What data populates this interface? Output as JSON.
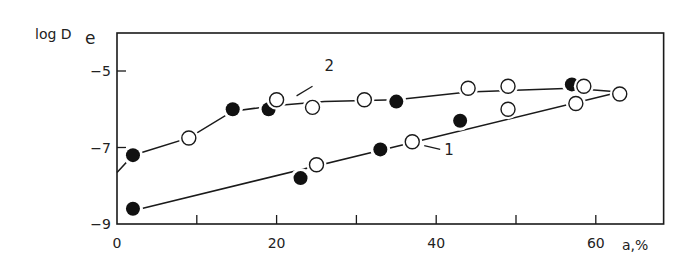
{
  "chart_data": {
    "type": "scatter",
    "title": "",
    "xlabel": "a,%",
    "ylabel": "log De",
    "ylabel_main": "log D",
    "ylabel_sub": "e",
    "xlim": [
      0,
      68.5
    ],
    "ylim": [
      -9,
      -4.2
    ],
    "xticks": [
      0,
      10,
      20,
      30,
      40,
      50,
      60
    ],
    "xtick_labels": [
      "0",
      "20",
      "40",
      "60"
    ],
    "xtick_label_values": [
      0,
      20,
      40,
      60
    ],
    "yticks": [
      -5,
      -7,
      -9
    ],
    "ytick_labels": [
      "−5",
      "−7",
      "−9"
    ],
    "grid": false,
    "legend": "none (curves labeled inline with '1' and '2')",
    "series": [
      {
        "name": "2",
        "label_pos": {
          "x": 26,
          "y": -5.0
        },
        "leader_from": {
          "x": 24.5,
          "y": -5.4
        },
        "leader_to": {
          "x": 22.5,
          "y": -5.65
        },
        "fit_line": [
          [
            0,
            -7.65
          ],
          [
            2,
            -7.2
          ],
          [
            9,
            -6.75
          ],
          [
            14.5,
            -6.05
          ],
          [
            20,
            -5.9
          ],
          [
            26,
            -5.8
          ],
          [
            35,
            -5.75
          ],
          [
            44,
            -5.55
          ],
          [
            57,
            -5.45
          ],
          [
            63,
            -5.55
          ]
        ],
        "points": [
          {
            "x": 2,
            "y": -7.2,
            "marker": "filled"
          },
          {
            "x": 9,
            "y": -6.75,
            "marker": "open"
          },
          {
            "x": 14.5,
            "y": -6.0,
            "marker": "filled"
          },
          {
            "x": 19,
            "y": -6.0,
            "marker": "filled"
          },
          {
            "x": 20,
            "y": -5.75,
            "marker": "open"
          },
          {
            "x": 24.5,
            "y": -5.95,
            "marker": "open"
          },
          {
            "x": 31,
            "y": -5.75,
            "marker": "open"
          },
          {
            "x": 35,
            "y": -5.8,
            "marker": "filled"
          },
          {
            "x": 44,
            "y": -5.45,
            "marker": "open"
          },
          {
            "x": 49,
            "y": -5.4,
            "marker": "open"
          },
          {
            "x": 57,
            "y": -5.35,
            "marker": "filled"
          },
          {
            "x": 58.5,
            "y": -5.4,
            "marker": "open"
          },
          {
            "x": 63,
            "y": -5.6,
            "marker": "open"
          }
        ]
      },
      {
        "name": "1",
        "label_pos": {
          "x": 41,
          "y": -7.2
        },
        "leader_from": {
          "x": 38.5,
          "y": -6.95
        },
        "leader_to": {
          "x": 40.5,
          "y": -7.05
        },
        "fit_line": [
          [
            3,
            -8.6
          ],
          [
            63,
            -5.55
          ]
        ],
        "points": [
          {
            "x": 2,
            "y": -8.6,
            "marker": "filled"
          },
          {
            "x": 23,
            "y": -7.8,
            "marker": "filled"
          },
          {
            "x": 25,
            "y": -7.45,
            "marker": "open"
          },
          {
            "x": 33,
            "y": -7.05,
            "marker": "filled"
          },
          {
            "x": 37,
            "y": -6.85,
            "marker": "open"
          },
          {
            "x": 43,
            "y": -6.3,
            "marker": "filled"
          },
          {
            "x": 49,
            "y": -6.0,
            "marker": "open"
          },
          {
            "x": 57.5,
            "y": -5.85,
            "marker": "open"
          }
        ]
      }
    ]
  }
}
